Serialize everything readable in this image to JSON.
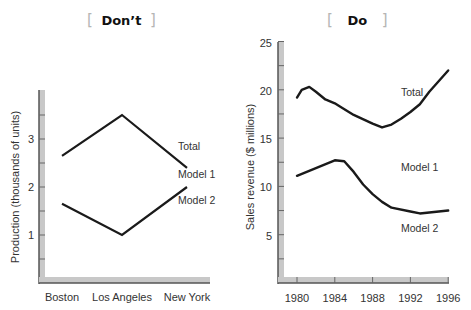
{
  "panels": {
    "left": {
      "title_bracket_open": "[",
      "title": "Don’t",
      "title_bracket_close": "]"
    },
    "right": {
      "title_bracket_open": "[",
      "title": "Do",
      "title_bracket_close": "]"
    }
  },
  "colors": {
    "line": "#1a1a1a",
    "axis_bar": "#c8c8c8",
    "axis_edge": "#555555",
    "bracket": "#b5b5b5"
  },
  "chart_data": [
    {
      "type": "line",
      "title": "Don’t",
      "xlabel": "",
      "ylabel": "Production (thousands of units)",
      "categories": [
        "Boston",
        "Los Angeles",
        "New York"
      ],
      "series": [
        {
          "name": "Total",
          "values": [
            2.65,
            3.5,
            2.4
          ]
        },
        {
          "name": "Model 2",
          "values": [
            1.65,
            1.0,
            2.0
          ]
        }
      ],
      "series_labels": [
        "Total",
        "Model 1",
        "Model 2"
      ],
      "yticks": [
        1,
        2,
        3
      ],
      "ylim": [
        0,
        4
      ],
      "grid": false,
      "legend_position": "inline-right"
    },
    {
      "type": "line",
      "title": "Do",
      "xlabel": "",
      "ylabel": "Sales revenue ($ millions)",
      "x": [
        1980,
        1980.5,
        1981.3,
        1982,
        1983,
        1984,
        1984.5,
        1986,
        1988,
        1989,
        1990,
        1991,
        1992,
        1993,
        1994,
        1996
      ],
      "series": [
        {
          "name": "Total",
          "values": [
            19.2,
            20.0,
            20.3,
            19.8,
            19.0,
            18.6,
            18.3,
            17.4,
            16.5,
            16.1,
            16.4,
            17.0,
            17.7,
            18.5,
            19.8,
            22.0
          ]
        },
        {
          "name": "Model 1",
          "x": [
            1980,
            1982,
            1984,
            1985,
            1986,
            1987,
            1988,
            1989,
            1990,
            1992,
            1993,
            1994,
            1996
          ],
          "values": [
            11.1,
            11.9,
            12.7,
            12.6,
            11.5,
            10.2,
            9.2,
            8.4,
            7.8,
            7.4,
            7.2,
            7.3,
            7.5
          ]
        }
      ],
      "series_labels": [
        "Total",
        "Model 1",
        "Model 2"
      ],
      "xticks": [
        1980,
        1984,
        1988,
        1992,
        1996
      ],
      "yticks": [
        5,
        10,
        15,
        20,
        25
      ],
      "ylim": [
        0,
        25
      ],
      "xlim": [
        1978,
        1996
      ],
      "grid": false,
      "legend_position": "inline-right"
    }
  ]
}
